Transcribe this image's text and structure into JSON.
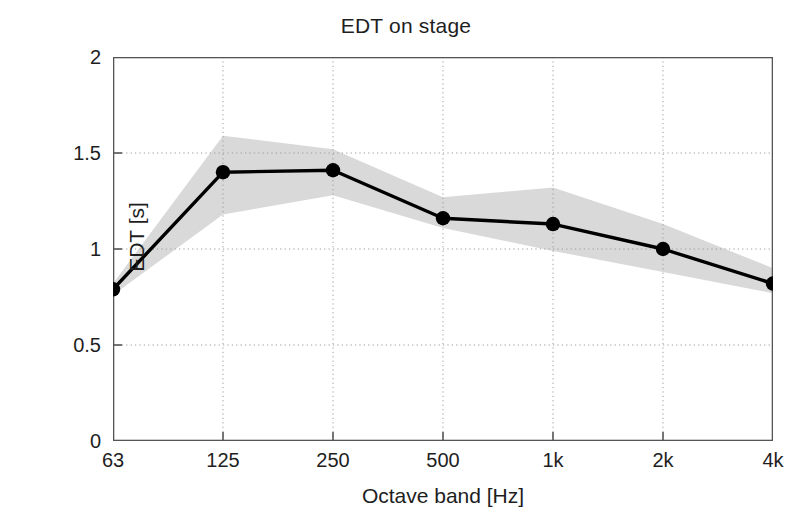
{
  "chart_data": {
    "type": "line",
    "title": "EDT on stage",
    "xlabel": "Octave band [Hz]",
    "ylabel": "EDT [s]",
    "categories": [
      "63",
      "125",
      "250",
      "500",
      "1k",
      "2k",
      "4k"
    ],
    "values": [
      0.79,
      1.4,
      1.41,
      1.16,
      1.13,
      1.0,
      0.82
    ],
    "series": [
      {
        "name": "EDT mean",
        "values": [
          0.79,
          1.4,
          1.41,
          1.16,
          1.13,
          1.0,
          0.82
        ]
      },
      {
        "name": "spread band upper",
        "values": [
          0.82,
          1.59,
          1.52,
          1.27,
          1.32,
          1.13,
          0.9
        ]
      },
      {
        "name": "spread band lower",
        "values": [
          0.76,
          1.18,
          1.28,
          1.11,
          0.99,
          0.88,
          0.77
        ]
      }
    ],
    "ylim": [
      0,
      2
    ],
    "yticks": [
      0,
      0.5,
      1,
      1.5,
      2
    ],
    "ytick_labels": [
      "0",
      "0.5",
      "1",
      "1.5",
      "2"
    ],
    "grid": true,
    "grid_style": "dotted",
    "legend": "none",
    "colors": {
      "line": "#000000",
      "marker": "#000000",
      "band": "#d9d9d9",
      "grid": "#9a9a9a",
      "axis": "#4d4d4d",
      "background": "#ffffff"
    }
  }
}
